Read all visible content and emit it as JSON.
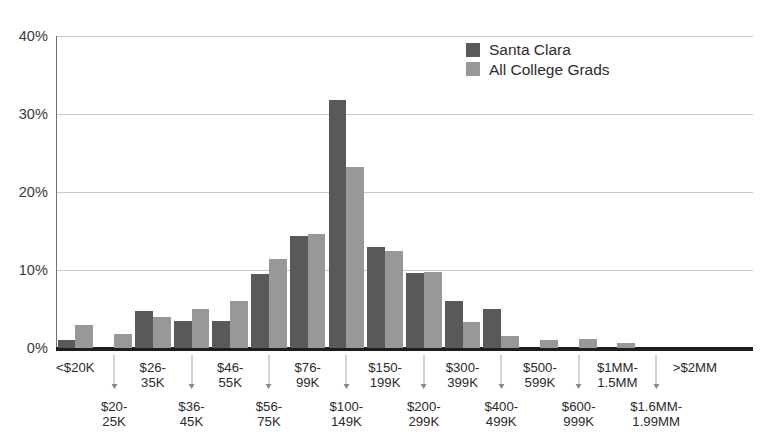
{
  "chart_data": {
    "type": "bar",
    "title": "",
    "subtitle": "",
    "xlabel": "",
    "ylabel": "",
    "ylim": [
      0,
      40
    ],
    "yticks": [
      0,
      10,
      20,
      30,
      40
    ],
    "ytick_labels": [
      "0%",
      "10%",
      "20%",
      "30%",
      "40%"
    ],
    "grid": true,
    "legend_position": "top-right",
    "categories": [
      "<$20K",
      "$20-\n25K",
      "$26-\n35K",
      "$36-\n45K",
      "$46-\n55K",
      "$56-\n75K",
      "$76-\n99K",
      "$100-\n149K",
      "$150-\n199K",
      "$200-\n299K",
      "$300-\n399K",
      "$400-\n499K",
      "$500-\n599K",
      "$600-\n999K",
      "$1MM-\n1.5MM",
      "$1.6MM-\n1.99MM",
      ">$2MM",
      ""
    ],
    "category_rows": [
      "top",
      "bottom",
      "top",
      "bottom",
      "top",
      "bottom",
      "top",
      "bottom",
      "top",
      "bottom",
      "top",
      "bottom",
      "top",
      "bottom",
      "top",
      "bottom",
      "top",
      "bottom"
    ],
    "series": [
      {
        "name": "Santa Clara",
        "color": "#595959",
        "values": [
          1.0,
          0.0,
          4.7,
          3.5,
          3.5,
          9.5,
          14.4,
          31.8,
          13.0,
          9.6,
          6.0,
          5.0,
          0.0,
          0.0,
          0.0,
          0.0,
          0.0,
          0.0
        ]
      },
      {
        "name": "All College Grads",
        "color": "#989898",
        "values": [
          3.0,
          1.8,
          4.0,
          5.0,
          6.0,
          11.4,
          14.6,
          23.2,
          12.5,
          9.7,
          3.3,
          1.5,
          1.0,
          1.2,
          0.7,
          0.0,
          0.0,
          0.0
        ]
      }
    ]
  },
  "legend": {
    "items": [
      {
        "label": "Santa Clara",
        "color": "#595959"
      },
      {
        "label": "All College Grads",
        "color": "#989898"
      }
    ]
  },
  "axis": {
    "y_labels": [
      "40%",
      "30%",
      "20%",
      "10%",
      "0%"
    ]
  },
  "colors": {
    "santa_clara": "#595959",
    "all_college_grads": "#989898",
    "gridline": "#c9c9c9",
    "axis": "#1d1d1d",
    "background": "#ffffff"
  }
}
